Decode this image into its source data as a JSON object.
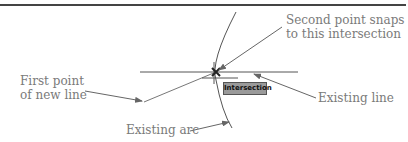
{
  "diagram": {
    "labels": {
      "second_point": [
        "Second point snaps",
        "to this intersection"
      ],
      "first_point": [
        "First point",
        "of new line"
      ],
      "existing_line": "Existing line",
      "existing_arc": "Existing arc"
    },
    "tooltip": "Intersection",
    "colors": {
      "rule": "#444444",
      "lines": "#555555",
      "label": "#7a7a7a",
      "tooltip_bg": "#9a9a9a"
    }
  }
}
